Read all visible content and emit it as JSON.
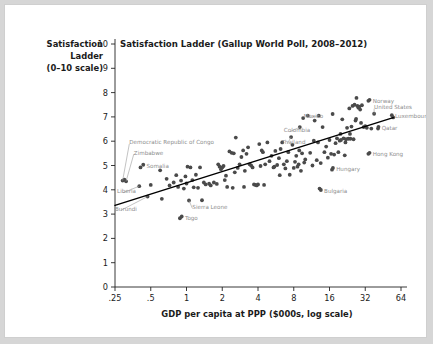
{
  "figure": {
    "title": "Satisfaction Ladder (Gallup World Poll, 2008–2012)",
    "y_axis_label_line1": "Satisfaction",
    "y_axis_label_line2": "Ladder",
    "y_axis_label_line3": "(0–10 scale)",
    "x_axis_label": "GDP per capita at PPP ($000s, log scale)",
    "background_color": "#ffffff",
    "page_color": "#d6d6d6",
    "dot_color": "#4a4a4a",
    "annotation_color": "#8d8d8d",
    "fit_line_color": "#000000"
  },
  "chart_data": {
    "type": "scatter",
    "title": "Satisfaction Ladder (Gallup World Poll, 2008–2012)",
    "xlabel": "GDP per capita at PPP ($000s, log scale)",
    "ylabel": "Satisfaction Ladder (0–10 scale)",
    "xscale": "log2",
    "xlim": [
      0.25,
      64
    ],
    "ylim": [
      0,
      10
    ],
    "xticks": [
      ".25",
      ".5",
      "1",
      "2",
      "4",
      "8",
      "16",
      "32",
      "64"
    ],
    "xtick_values": [
      0.25,
      0.5,
      1,
      2,
      4,
      8,
      16,
      32,
      64
    ],
    "yticks": [
      "0",
      "1",
      "2",
      "3",
      "4",
      "5",
      "6",
      "7",
      "8",
      "9",
      "10"
    ],
    "ytick_values": [
      0,
      1,
      2,
      3,
      4,
      5,
      6,
      7,
      8,
      9,
      10
    ],
    "grid": false,
    "legend": "none",
    "fit_line": {
      "label": "linear fit",
      "x_start": 0.25,
      "y_start": 3.36,
      "x_end": 55.0,
      "y_end": 6.97
    },
    "labeled_points": [
      {
        "name": "Democratic Republic of Congo",
        "x": 0.29,
        "y": 4.38,
        "label_x": 0.33,
        "label_y": 5.95,
        "leader": true
      },
      {
        "name": "Zimbabwe",
        "x": 0.31,
        "y": 4.35,
        "label_x": 0.36,
        "label_y": 5.53,
        "leader": true
      },
      {
        "name": "Somalia",
        "x": 0.41,
        "y": 4.92,
        "label_x": 0.46,
        "label_y": 4.99,
        "leader": false
      },
      {
        "name": "Liberia",
        "x": 0.4,
        "y": 4.15,
        "label_x": 0.26,
        "label_y": 3.94,
        "leader": true
      },
      {
        "name": "Burundi",
        "x": 0.47,
        "y": 3.72,
        "label_x": 0.25,
        "label_y": 3.22,
        "leader": true
      },
      {
        "name": "Sierra Leone",
        "x": 1.05,
        "y": 3.56,
        "label_x": 1.12,
        "label_y": 3.3,
        "leader": true
      },
      {
        "name": "Togo",
        "x": 0.88,
        "y": 2.83,
        "label_x": 0.97,
        "label_y": 2.86,
        "leader": false
      },
      {
        "name": "Thailand",
        "x": 7.6,
        "y": 6.17,
        "label_x": 6.3,
        "label_y": 5.97,
        "leader": true
      },
      {
        "name": "Colombia",
        "x": 9.0,
        "y": 6.58,
        "label_x": 6.6,
        "label_y": 6.45,
        "leader": true
      },
      {
        "name": "Mexico",
        "x": 13.0,
        "y": 7.05,
        "label_x": 9.7,
        "label_y": 7.04,
        "leader": true
      },
      {
        "name": "Hungary",
        "x": 16.8,
        "y": 4.83,
        "label_x": 18.2,
        "label_y": 4.86,
        "leader": false
      },
      {
        "name": "Bulgaria",
        "x": 13.2,
        "y": 4.05,
        "label_x": 14.4,
        "label_y": 3.95,
        "leader": false
      },
      {
        "name": "Hong Kong",
        "x": 34.0,
        "y": 5.48,
        "label_x": 37.0,
        "label_y": 5.48,
        "leader": false
      },
      {
        "name": "Norway",
        "x": 34.0,
        "y": 7.66,
        "label_x": 37.0,
        "label_y": 7.66,
        "leader": false
      },
      {
        "name": "United States",
        "x": 38.0,
        "y": 7.13,
        "label_x": 38.0,
        "label_y": 7.4,
        "leader": true
      },
      {
        "name": "Luxembourg",
        "x": 55.0,
        "y": 6.98,
        "label_x": 57.0,
        "label_y": 7.03,
        "leader": false
      },
      {
        "name": "Qatar",
        "x": 41.0,
        "y": 6.52,
        "label_x": 44.0,
        "label_y": 6.55,
        "leader": false
      }
    ],
    "points": [
      [
        0.29,
        4.38
      ],
      [
        0.31,
        4.35
      ],
      [
        0.3,
        4.42
      ],
      [
        0.41,
        4.92
      ],
      [
        0.4,
        4.15
      ],
      [
        0.47,
        3.72
      ],
      [
        0.5,
        4.2
      ],
      [
        0.6,
        4.8
      ],
      [
        0.62,
        3.63
      ],
      [
        0.68,
        4.45
      ],
      [
        0.72,
        4.18
      ],
      [
        0.78,
        4.3
      ],
      [
        0.82,
        4.6
      ],
      [
        0.85,
        4.12
      ],
      [
        0.88,
        2.83
      ],
      [
        0.9,
        4.38
      ],
      [
        0.95,
        4.05
      ],
      [
        0.98,
        4.55
      ],
      [
        1.0,
        4.26
      ],
      [
        1.02,
        4.95
      ],
      [
        1.05,
        3.56
      ],
      [
        1.08,
        4.92
      ],
      [
        1.12,
        4.4
      ],
      [
        1.15,
        4.1
      ],
      [
        1.2,
        4.62
      ],
      [
        1.25,
        4.08
      ],
      [
        1.3,
        4.92
      ],
      [
        1.35,
        3.57
      ],
      [
        1.4,
        4.3
      ],
      [
        1.45,
        4.22
      ],
      [
        1.55,
        4.25
      ],
      [
        1.6,
        4.18
      ],
      [
        1.7,
        4.3
      ],
      [
        1.8,
        4.24
      ],
      [
        1.85,
        5.05
      ],
      [
        1.9,
        4.95
      ],
      [
        1.95,
        4.85
      ],
      [
        2.0,
        4.92
      ],
      [
        2.05,
        4.98
      ],
      [
        2.1,
        4.4
      ],
      [
        2.15,
        4.58
      ],
      [
        2.2,
        4.12
      ],
      [
        2.3,
        5.58
      ],
      [
        2.4,
        5.52
      ],
      [
        2.5,
        5.5
      ],
      [
        2.55,
        4.72
      ],
      [
        2.6,
        6.15
      ],
      [
        2.7,
        4.9
      ],
      [
        2.8,
        5.05
      ],
      [
        2.9,
        5.35
      ],
      [
        3.0,
        5.62
      ],
      [
        3.1,
        4.78
      ],
      [
        3.2,
        5.48
      ],
      [
        3.3,
        5.75
      ],
      [
        3.4,
        5.05
      ],
      [
        3.5,
        5.0
      ],
      [
        3.6,
        4.92
      ],
      [
        3.7,
        4.22
      ],
      [
        3.8,
        4.2
      ],
      [
        3.9,
        4.18
      ],
      [
        4.0,
        4.22
      ],
      [
        4.1,
        5.88
      ],
      [
        4.2,
        4.98
      ],
      [
        4.3,
        5.62
      ],
      [
        4.4,
        5.55
      ],
      [
        4.5,
        4.2
      ],
      [
        4.6,
        5.05
      ],
      [
        4.8,
        5.95
      ],
      [
        5.0,
        5.18
      ],
      [
        5.2,
        5.4
      ],
      [
        5.4,
        4.92
      ],
      [
        5.6,
        5.6
      ],
      [
        5.8,
        5.02
      ],
      [
        6.0,
        5.3
      ],
      [
        6.2,
        5.68
      ],
      [
        6.4,
        5.95
      ],
      [
        6.6,
        5.05
      ],
      [
        6.8,
        4.88
      ],
      [
        7.0,
        5.18
      ],
      [
        7.2,
        5.55
      ],
      [
        7.4,
        4.62
      ],
      [
        7.6,
        6.17
      ],
      [
        7.8,
        5.85
      ],
      [
        8.0,
        4.9
      ],
      [
        8.2,
        5.15
      ],
      [
        8.4,
        5.4
      ],
      [
        8.6,
        4.95
      ],
      [
        8.8,
        5.05
      ],
      [
        9.0,
        6.58
      ],
      [
        9.2,
        4.78
      ],
      [
        9.4,
        5.5
      ],
      [
        9.6,
        6.95
      ],
      [
        9.8,
        5.12
      ],
      [
        10.0,
        5.25
      ],
      [
        10.5,
        7.05
      ],
      [
        11.0,
        5.52
      ],
      [
        11.5,
        5.0
      ],
      [
        12.0,
        6.85
      ],
      [
        12.5,
        5.22
      ],
      [
        13.0,
        7.05
      ],
      [
        13.2,
        4.05
      ],
      [
        13.5,
        5.1
      ],
      [
        14.0,
        6.58
      ],
      [
        14.5,
        5.55
      ],
      [
        15.0,
        5.78
      ],
      [
        15.5,
        5.32
      ],
      [
        16.0,
        6.05
      ],
      [
        16.5,
        5.48
      ],
      [
        16.8,
        4.83
      ],
      [
        17.0,
        7.12
      ],
      [
        17.5,
        5.45
      ],
      [
        18.0,
        5.92
      ],
      [
        18.5,
        6.12
      ],
      [
        19.0,
        5.55
      ],
      [
        19.5,
        6.02
      ],
      [
        20.0,
        6.05
      ],
      [
        20.5,
        6.9
      ],
      [
        21.0,
        6.12
      ],
      [
        21.5,
        5.42
      ],
      [
        22.0,
        6.08
      ],
      [
        22.5,
        6.55
      ],
      [
        23.0,
        6.1
      ],
      [
        23.5,
        7.35
      ],
      [
        24.0,
        6.1
      ],
      [
        24.5,
        6.6
      ],
      [
        25.0,
        7.45
      ],
      [
        25.5,
        6.08
      ],
      [
        26.0,
        7.5
      ],
      [
        26.5,
        6.85
      ],
      [
        27.0,
        7.78
      ],
      [
        27.5,
        7.45
      ],
      [
        28.0,
        7.38
      ],
      [
        28.5,
        7.42
      ],
      [
        29.0,
        7.3
      ],
      [
        29.5,
        6.75
      ],
      [
        30.0,
        7.48
      ],
      [
        31.0,
        6.58
      ],
      [
        32.0,
        6.62
      ],
      [
        33.0,
        6.55
      ],
      [
        34.0,
        7.66
      ],
      [
        34.0,
        5.48
      ],
      [
        36.0,
        6.52
      ],
      [
        38.0,
        7.13
      ],
      [
        41.0,
        6.52
      ],
      [
        55.0,
        6.98
      ],
      [
        2.45,
        4.08
      ],
      [
        3.05,
        4.12
      ],
      [
        5.5,
        4.95
      ],
      [
        6.1,
        4.6
      ],
      [
        12.8,
        5.95
      ],
      [
        19.8,
        6.3
      ],
      [
        23.8,
        6.3
      ],
      [
        26.8,
        6.92
      ],
      [
        21.8,
        5.95
      ],
      [
        8.9,
        5.62
      ],
      [
        11.8,
        6.02
      ]
    ]
  }
}
